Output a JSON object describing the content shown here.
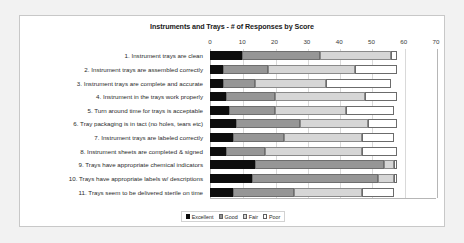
{
  "chart_data": {
    "type": "bar",
    "orientation": "horizontal",
    "stacked": true,
    "title": "Instruments and Trays - # of Responses by Score",
    "xlabel": "",
    "ylabel": "",
    "xlim": [
      0,
      70
    ],
    "xticks": [
      0,
      10,
      20,
      30,
      40,
      50,
      60,
      70
    ],
    "grid": true,
    "legend_position": "bottom",
    "categories": [
      "1. Instrument trays are clean",
      "2. Instrument trays are assembled correctly",
      "3. Instrument trays are complete and accurate",
      "4. Instrument in the trays work properly",
      "5. Turn around time for trays is acceptable",
      "6. Tray packaging is in tact (no holes, tears etc)",
      "7. Instrument trays are labeled correctly",
      "8. Instrument sheets are completed & signed",
      "9. Trays have appropriate chemical indicators",
      "10. Trays have appropriate labels w/ descriptions",
      "11. Trays seem to be delivered sterile on time"
    ],
    "series": [
      {
        "name": "Excellent",
        "color": "#0d0d0d",
        "values": [
          10,
          4,
          4,
          5,
          6,
          8,
          7,
          5,
          14,
          13,
          7
        ]
      },
      {
        "name": "Good",
        "color": "#969696",
        "values": [
          24,
          14,
          10,
          15,
          14,
          20,
          16,
          12,
          40,
          39,
          19
        ]
      },
      {
        "name": "Fair",
        "color": "#d6d6d6",
        "values": [
          22,
          27,
          22,
          28,
          22,
          21,
          24,
          30,
          3,
          5,
          21
        ]
      },
      {
        "name": "Poor",
        "color": "#ffffff",
        "values": [
          2,
          13,
          20,
          10,
          15,
          9,
          10,
          11,
          1,
          1,
          10
        ]
      }
    ]
  }
}
